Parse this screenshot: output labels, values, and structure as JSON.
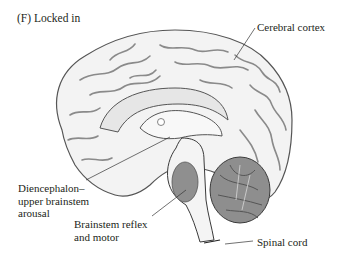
{
  "figure": {
    "panel_title": "(F)  Locked in",
    "labels": {
      "cerebral_cortex": "Cerebral cortex",
      "diencephalon_line1": "Diencephalon–",
      "diencephalon_line2": "upper brainstem",
      "diencephalon_line3": "arousal",
      "brainstem_line1": "Brainstem reflex",
      "brainstem_line2": "and motor",
      "spinal_cord": "Spinal cord"
    },
    "colors": {
      "cortex_fill": "#f2f2f2",
      "sulci_stroke": "#8a8a8a",
      "lesion_fill": "#8f8f8f",
      "cerebellum_fill": "#9a9a9a",
      "outline": "#3a3a3a"
    }
  }
}
